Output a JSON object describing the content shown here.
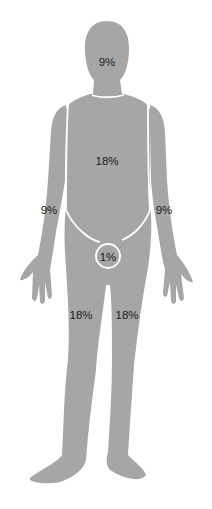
{
  "diagram": {
    "fill_color": "#a6a6a6",
    "divider_color": "#ffffff",
    "labels": {
      "head": "9%",
      "torso": "18%",
      "left_arm": "9%",
      "right_arm": "9%",
      "genitals": "1%",
      "left_leg": "18%",
      "right_leg": "18%"
    }
  }
}
